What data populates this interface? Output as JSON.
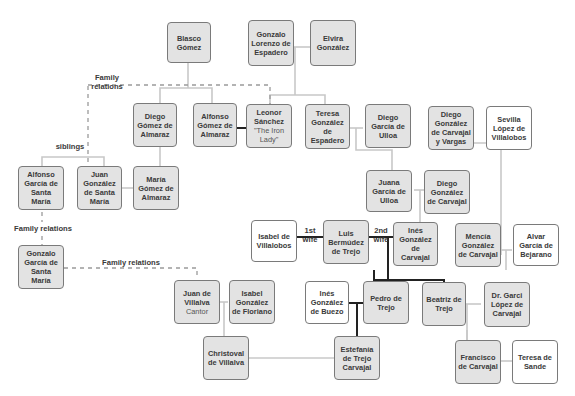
{
  "persons": {
    "blasco": {
      "name": "Blasco Gómez"
    },
    "gonzalo_lorenzo": {
      "name": "Gonzalo Lorenzo de Espadero"
    },
    "elvira": {
      "name": "Elvira González"
    },
    "diego_gomez": {
      "name": "Diego Gómez de Almaraz"
    },
    "alfonso_gomez": {
      "name": "Alfonso Gómez de Almaraz"
    },
    "leonor": {
      "name": "Leonor Sánchez",
      "nickname": "\"The Iron Lady\""
    },
    "teresa_gonzalez": {
      "name": "Teresa González de Espadero"
    },
    "diego_garcia_ulloa": {
      "name": "Diego García de Ulloa"
    },
    "diego_gonzalez_vargas": {
      "name": "Diego González de Carvajal y Vargas"
    },
    "sevilla": {
      "name": "Sevilla López de Villalobos"
    },
    "alfonso_garcia": {
      "name": "Alfonso García de Santa María"
    },
    "juan_gonzalez_sm": {
      "name": "Juan González de Santa María"
    },
    "maria_gomez": {
      "name": "María Gómez de Almaraz"
    },
    "juana_garcia": {
      "name": "Juana García de Ulloa"
    },
    "diego_gonzalez_carvajal": {
      "name": "Diego González de Carvajal"
    },
    "gonzalo_garcia": {
      "name": "Gonzalo García de Santa María"
    },
    "isabel_villalobos": {
      "name": "Isabel de Villalobos"
    },
    "luis": {
      "name": "Luis Bermúdez de Trejo"
    },
    "ines_carvajal": {
      "name": "Inés González de Carvajal"
    },
    "mencia": {
      "name": "Mencía González de Carvajal"
    },
    "alvar": {
      "name": "Alvar García de Bejarano"
    },
    "juan_villalva": {
      "name": "Juan de Villalva",
      "title": "Cantor"
    },
    "isabel_floriano": {
      "name": "Isabel González de Floriano"
    },
    "ines_buezo": {
      "name": "Inés González de Buezo"
    },
    "pedro": {
      "name": "Pedro de Trejo"
    },
    "beatriz": {
      "name": "Beatriz de Trejo"
    },
    "garci": {
      "name": "Dr. Garci López de Carvajal"
    },
    "christoval": {
      "name": "Christoval de Villalva"
    },
    "estefania": {
      "name": "Estefanía de Trejo Carvajal"
    },
    "francisco": {
      "name": "Francisco de Carvajal"
    },
    "teresa_sande": {
      "name": "Teresa de Sande"
    }
  },
  "labels": {
    "family_relations_top": "Family relations",
    "siblings": "siblings",
    "family_relations_left": "Family relations",
    "family_relations_mid": "Family relations",
    "first_wife": "1st wife",
    "second_wife": "2nd wife"
  },
  "colors": {
    "highlight_box": "#e3e3e3",
    "plain_box": "#ffffff",
    "line_light": "#c8c8c8",
    "line_dark": "#222222",
    "dashed": "#9a9a9a"
  }
}
